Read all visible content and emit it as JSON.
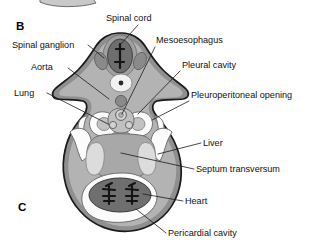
{
  "figure": {
    "panel_letters": [
      {
        "id": "panel-b",
        "text": "B",
        "x": 16,
        "y": 30
      },
      {
        "id": "panel-c",
        "text": "C",
        "x": 18,
        "y": 211
      }
    ],
    "colors": {
      "background": "#ffffff",
      "outer_body_wall": "#8f8f8f",
      "mesenchyme": "#b3b3b3",
      "mesenchyme_light": "#c6c6c6",
      "cavity_white": "#fbfbfb",
      "neural_tube": "#6e6e6e",
      "neural_canal": "#1a1a1a",
      "ganglion": "#8a8a8a",
      "aorta": "#8a8a8a",
      "notochord": "#f2f2f2",
      "liver": "#d8d8d8",
      "heart_muscle": "#6f6f6f",
      "heart_trabeculae": "#141414",
      "outline": "#1a1a1a",
      "label_text": "#101010",
      "leader_line": "#1a1a1a"
    },
    "labels": [
      {
        "id": "spinal-cord",
        "text": "Spinal cord",
        "text_x": 106,
        "text_y": 21,
        "anchor": "start",
        "leader": "M 138 25 L 120 45"
      },
      {
        "id": "spinal-ganglion",
        "text": "Spinal ganglion",
        "text_x": 12,
        "text_y": 48,
        "anchor": "start",
        "leader": "M 88 45 L 104 58"
      },
      {
        "id": "mesoesophagus",
        "text": "Mesoesophagus",
        "text_x": 156,
        "text_y": 43,
        "anchor": "start",
        "leader": "M 155 47 L 122 114"
      },
      {
        "id": "aorta",
        "text": "Aorta",
        "text_x": 31,
        "text_y": 70,
        "anchor": "start",
        "leader": "M 68 68 L 109 99"
      },
      {
        "id": "pleural-cavity",
        "text": "Pleural cavity",
        "text_x": 182,
        "text_y": 68,
        "anchor": "start",
        "leader": "M 180 71 L 138 114"
      },
      {
        "id": "lung",
        "text": "Lung",
        "text_x": 14,
        "text_y": 96,
        "anchor": "start",
        "leader": "M 47 93 L 108 124"
      },
      {
        "id": "pleuroperitoneal-opening",
        "text": "Pleuroperitoneal opening",
        "text_x": 191,
        "text_y": 98,
        "anchor": "start",
        "leader": "M 189 101 L 152 120"
      },
      {
        "id": "liver",
        "text": "Liver",
        "text_x": 203,
        "text_y": 146,
        "anchor": "start",
        "leader": "M 201 143 L 158 154"
      },
      {
        "id": "septum-transversum",
        "text": "Septum transversum",
        "text_x": 196,
        "text_y": 172,
        "anchor": "start",
        "leader": "M 194 169 L 121 153"
      },
      {
        "id": "heart",
        "text": "Heart",
        "text_x": 185,
        "text_y": 204,
        "anchor": "start",
        "leader": "M 183 201 L 143 194"
      },
      {
        "id": "pericardial-cavity",
        "text": "Pericardial cavity",
        "text_x": 168,
        "text_y": 236,
        "anchor": "start",
        "leader": "M 166 233 L 136 209"
      }
    ],
    "structures": [
      {
        "id": "body-wall",
        "name": "embryo-body-outline"
      },
      {
        "id": "neural-tube",
        "name": "neural-tube"
      },
      {
        "id": "neural-canal",
        "name": "neural-canal"
      },
      {
        "id": "spinal-ganglion-left",
        "name": "spinal-ganglion-left"
      },
      {
        "id": "spinal-ganglion-right",
        "name": "spinal-ganglion-right"
      },
      {
        "id": "notochord",
        "name": "notochord"
      },
      {
        "id": "dorsal-aorta",
        "name": "dorsal-aorta"
      },
      {
        "id": "esophagus",
        "name": "esophagus"
      },
      {
        "id": "bronchus-left",
        "name": "bronchus-left"
      },
      {
        "id": "bronchus-right",
        "name": "bronchus-right"
      },
      {
        "id": "lung-bud-left",
        "name": "lung-bud-left"
      },
      {
        "id": "lung-bud-right",
        "name": "lung-bud-right"
      },
      {
        "id": "pleural-cavity-left",
        "name": "pleural-cavity-left"
      },
      {
        "id": "pleural-cavity-right",
        "name": "pleural-cavity-right"
      },
      {
        "id": "pleuroperitoneal-opening-left",
        "name": "pleuroperitoneal-opening-left"
      },
      {
        "id": "pleuroperitoneal-opening-right",
        "name": "pleuroperitoneal-opening-right"
      },
      {
        "id": "liver-left-lobe",
        "name": "liver-left-lobe"
      },
      {
        "id": "liver-right-lobe",
        "name": "liver-right-lobe"
      },
      {
        "id": "septum-transversum-mass",
        "name": "septum-transversum-mass"
      },
      {
        "id": "pericardial-cavity-space",
        "name": "pericardial-cavity-space"
      },
      {
        "id": "heart-tube",
        "name": "heart-tube"
      },
      {
        "id": "heart-trabecula-left",
        "name": "heart-trabecula-left"
      },
      {
        "id": "heart-trabecula-right",
        "name": "heart-trabecula-right"
      }
    ]
  }
}
